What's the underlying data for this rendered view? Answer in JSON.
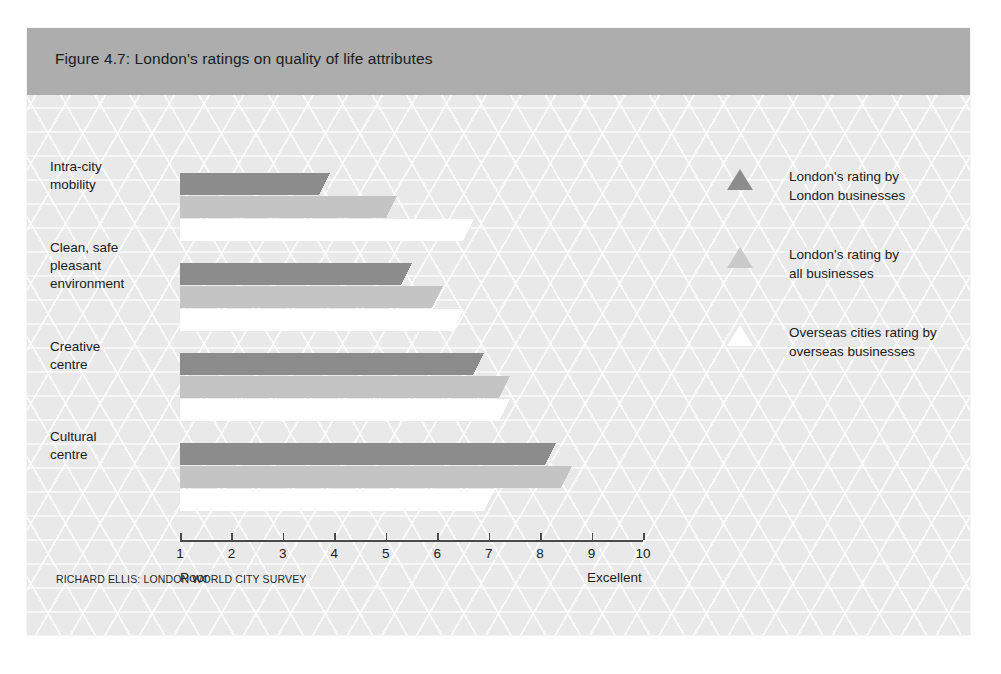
{
  "figure": {
    "title": "Figure 4.7: London's ratings on quality of life attributes",
    "source_note": "RICHARD ELLIS: LONDON WORLD CITY SURVEY",
    "header_color": "#adadad",
    "background_color": "#e9e9e9"
  },
  "legend": {
    "items": [
      {
        "marker": "triangle-dark",
        "color": "#8c8c8c",
        "line1": "London's rating by",
        "line2": "London businesses"
      },
      {
        "marker": "triangle-light",
        "color": "#c9c9c9",
        "line1": "London's rating by",
        "line2": "all businesses"
      },
      {
        "marker": "triangle-white",
        "color": "#ffffff",
        "line1": "Overseas cities rating by",
        "line2": "overseas businesses"
      }
    ]
  },
  "axis": {
    "ticks": [
      "1",
      "2",
      "3",
      "4",
      "5",
      "6",
      "7",
      "8",
      "9",
      "10"
    ],
    "low_label": "Poor",
    "high_label": "Excellent"
  },
  "chart_data": {
    "type": "bar",
    "orientation": "horizontal",
    "title": "Figure 4.7: London's ratings on quality of life attributes",
    "xlabel": "",
    "ylabel": "",
    "xlim": [
      1,
      10
    ],
    "grid": false,
    "legend_position": "right",
    "axis_low_label": "Poor",
    "axis_high_label": "Excellent",
    "categories": [
      "Intra-city mobility",
      "Clean, safe pleasant environment",
      "Creative centre",
      "Cultural centre"
    ],
    "category_lines": [
      [
        "Intra-city",
        "mobility"
      ],
      [
        "Clean, safe",
        "pleasant",
        "environment"
      ],
      [
        "Creative",
        "centre"
      ],
      [
        "Cultural",
        "centre"
      ]
    ],
    "series": [
      {
        "name": "London's rating by London businesses",
        "color": "#8c8c8c",
        "values": [
          3.7,
          5.3,
          6.7,
          8.1
        ]
      },
      {
        "name": "London's rating by all businesses",
        "color": "#c4c4c4",
        "values": [
          5.0,
          5.9,
          7.2,
          8.4
        ]
      },
      {
        "name": "Overseas cities rating by overseas businesses",
        "color": "#ffffff",
        "values": [
          6.5,
          6.3,
          7.2,
          6.9
        ]
      }
    ]
  }
}
